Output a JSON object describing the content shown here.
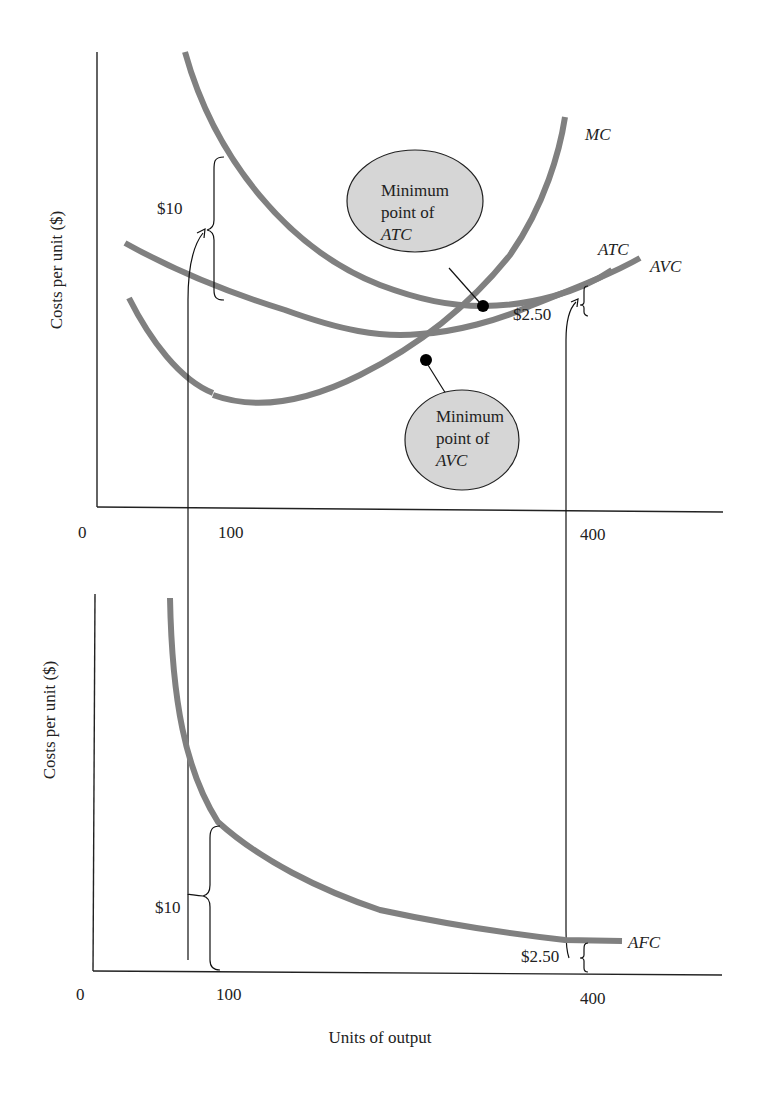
{
  "top_panel": {
    "y_axis_label": "Costs per unit ($)",
    "x_ticks": {
      "origin": "0",
      "q1": "100",
      "q2": "400"
    },
    "curve_labels": {
      "mc": "MC",
      "atc": "ATC",
      "avc": "AVC"
    },
    "brace_labels": {
      "afc_at_100": "$10",
      "afc_at_400": "$2.50"
    },
    "callouts": {
      "min_atc": {
        "line1": "Minimum",
        "line2": "point of",
        "line3": "ATC"
      },
      "min_avc": {
        "line1": "Minimum",
        "line2": "point of",
        "line3": "AVC"
      }
    }
  },
  "bottom_panel": {
    "y_axis_label": "Costs per unit ($)",
    "x_axis_label": "Units of output",
    "x_ticks": {
      "origin": "0",
      "q1": "100",
      "q2": "400"
    },
    "curve_labels": {
      "afc": "AFC"
    },
    "brace_labels": {
      "afc_at_100": "$10",
      "afc_at_400": "$2.50"
    }
  },
  "colors": {
    "curve": "#808080",
    "bubble": "#d6d6d6",
    "axis": "#222222"
  }
}
